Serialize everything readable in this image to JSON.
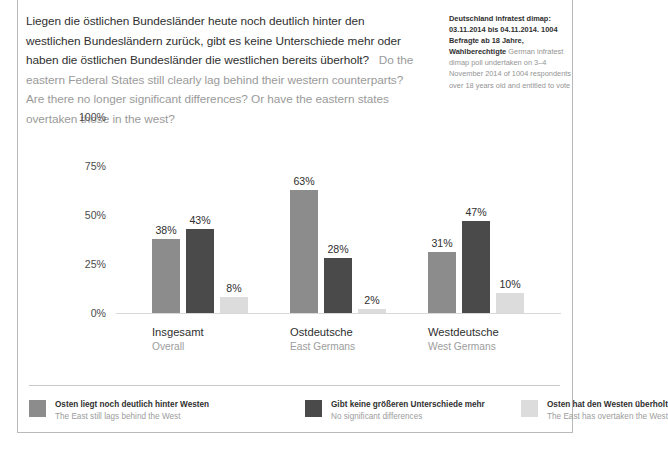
{
  "header": {
    "headline_de": "Liegen die östlichen Bundesländer heute noch deutlich hinter den westlichen Bundesländern zurück, gibt es keine Unterschiede mehr oder haben die östlichen Bundesländer die westlichen bereits überholt?",
    "headline_en": "Do the eastern Federal States still clearly lag behind their western counterparts? Are there no longer significant differences? Or have the eastern states overtaken those in the west?",
    "source_de": "Deutschland infratest dimap: 03.11.2014 bis 04.11.2014. 1004 Befragte ab 18 Jahre, Wahlberechtigte",
    "source_en": "German infratest dimap poll undertaken on 3–4 November 2014 of 1004 respondents over 18 years old and entitled to vote"
  },
  "chart_data": {
    "type": "bar",
    "title": "Liegen die östlichen Bundesländer heute noch deutlich hinter den westlichen Bundesländern zurück, gibt es keine Unterschiede mehr oder haben die östlichen Bundesländer die westlichen bereits überholt?",
    "xlabel": "",
    "ylabel": "",
    "ylim": [
      0,
      100
    ],
    "yticks": [
      0,
      25,
      50,
      75,
      100
    ],
    "ytick_labels": [
      "0%",
      "25%",
      "50%",
      "75%",
      "100%"
    ],
    "grid": false,
    "legend_position": "bottom",
    "categories": [
      "Insgesamt",
      "Ostdeutsche",
      "Westdeutsche"
    ],
    "categories_en": [
      "Overall",
      "East Germans",
      "West Germans"
    ],
    "series": [
      {
        "name": "Osten liegt noch deutlich hinter Westen",
        "name_en": "The East still lags behind the West",
        "color": "#8c8c8c",
        "values": [
          38,
          63,
          31
        ],
        "labels": [
          "38%",
          "63%",
          "31%"
        ]
      },
      {
        "name": "Gibt keine größeren Unterschiede mehr",
        "name_en": "No significant differences",
        "color": "#4a4a4a",
        "values": [
          43,
          28,
          47
        ],
        "labels": [
          "43%",
          "28%",
          "47%"
        ]
      },
      {
        "name": "Osten hat den Westen überholt",
        "name_en": "The East has overtaken the West",
        "color": "#dcdcdc",
        "values": [
          8,
          2,
          10
        ],
        "labels": [
          "8%",
          "2%",
          "10%"
        ]
      }
    ]
  },
  "colors": {
    "series_1": "#8c8c8c",
    "series_2": "#4a4a4a",
    "series_3": "#dcdcdc",
    "frame": "#b9b9b9",
    "separator": "#c9c9c9",
    "text_primary": "#2f2f2f",
    "text_secondary": "#9d9d9d"
  }
}
